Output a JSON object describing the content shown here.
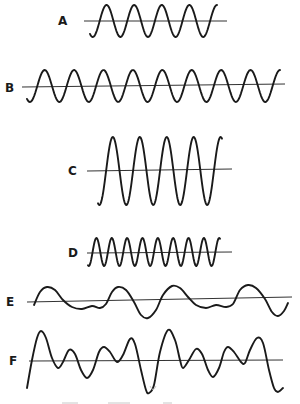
{
  "figure": {
    "background": "#ffffff",
    "ink_color": "#1a1a1a"
  },
  "waves": [
    {
      "label": "A",
      "kind": "sine",
      "label_pos": [
        58,
        25
      ],
      "baseline": [
        [
          84,
          21
        ],
        [
          227,
          21
        ]
      ],
      "x_start": 90,
      "x_end": 217,
      "center_y": 21,
      "amplitude": 16,
      "cycles": 4,
      "phase_start": -0.35,
      "description": "Medium amplitude, low frequency (4 cycles)"
    },
    {
      "label": "B",
      "kind": "sine",
      "label_pos": [
        5,
        92
      ],
      "baseline": [
        [
          22,
          87
        ],
        [
          285,
          84
        ]
      ],
      "x_start": 27,
      "x_end": 280,
      "center_y": 86,
      "amplitude": 16,
      "cycles": 8,
      "phase_start": -0.35,
      "description": "Medium amplitude, higher frequency (8 cycles)"
    },
    {
      "label": "C",
      "kind": "sine",
      "label_pos": [
        68,
        175
      ],
      "baseline": [
        [
          87,
          171
        ],
        [
          232,
          169
        ]
      ],
      "x_start": 98,
      "x_end": 222,
      "center_y": 171,
      "amplitude": 34,
      "cycles": 4,
      "phase_start": -0.3,
      "description": "Large amplitude, low frequency (4 cycles)"
    },
    {
      "label": "D",
      "kind": "sine",
      "label_pos": [
        68,
        257
      ],
      "baseline": [
        [
          87,
          253
        ],
        [
          232,
          252
        ]
      ],
      "x_start": 88,
      "x_end": 220,
      "center_y": 252,
      "amplitude": 14,
      "cycles": 8,
      "phase_start": -0.3,
      "description": "Medium amplitude, high frequency (8 cycles) compressed"
    },
    {
      "label": "E",
      "kind": "freehand",
      "label_pos": [
        6,
        306
      ],
      "baseline": [
        [
          27,
          302
        ],
        [
          292,
          297
        ]
      ],
      "points": [
        [
          34,
          305
        ],
        [
          40,
          292
        ],
        [
          47,
          287
        ],
        [
          55,
          290
        ],
        [
          63,
          300
        ],
        [
          72,
          307
        ],
        [
          82,
          309
        ],
        [
          92,
          306
        ],
        [
          100,
          308
        ],
        [
          106,
          304
        ],
        [
          112,
          292
        ],
        [
          118,
          287
        ],
        [
          126,
          290
        ],
        [
          134,
          302
        ],
        [
          141,
          315
        ],
        [
          148,
          318
        ],
        [
          156,
          310
        ],
        [
          163,
          295
        ],
        [
          172,
          286
        ],
        [
          180,
          288
        ],
        [
          188,
          297
        ],
        [
          196,
          305
        ],
        [
          206,
          308
        ],
        [
          216,
          305
        ],
        [
          226,
          307
        ],
        [
          233,
          304
        ],
        [
          240,
          290
        ],
        [
          248,
          285
        ],
        [
          256,
          288
        ],
        [
          265,
          299
        ],
        [
          272,
          312
        ],
        [
          278,
          316
        ],
        [
          284,
          311
        ],
        [
          288,
          303
        ]
      ],
      "description": "Complex low-amplitude wave with irregular repeating pattern"
    },
    {
      "label": "F",
      "kind": "freehand",
      "label_pos": [
        9,
        365
      ],
      "baseline": [
        [
          29,
          361
        ],
        [
          283,
          360
        ]
      ],
      "points": [
        [
          27,
          388
        ],
        [
          32,
          360
        ],
        [
          37,
          338
        ],
        [
          41,
          331
        ],
        [
          46,
          338
        ],
        [
          52,
          358
        ],
        [
          58,
          368
        ],
        [
          63,
          362
        ],
        [
          69,
          350
        ],
        [
          75,
          354
        ],
        [
          81,
          370
        ],
        [
          87,
          378
        ],
        [
          93,
          370
        ],
        [
          99,
          352
        ],
        [
          104,
          347
        ],
        [
          110,
          352
        ],
        [
          117,
          362
        ],
        [
          123,
          355
        ],
        [
          130,
          339
        ],
        [
          135,
          344
        ],
        [
          141,
          370
        ],
        [
          146,
          390
        ],
        [
          149,
          393
        ],
        [
          154,
          385
        ],
        [
          160,
          352
        ],
        [
          168,
          330
        ],
        [
          175,
          340
        ],
        [
          180,
          360
        ],
        [
          183,
          368
        ],
        [
          189,
          360
        ],
        [
          196,
          349
        ],
        [
          202,
          354
        ],
        [
          208,
          370
        ],
        [
          213,
          377
        ],
        [
          219,
          368
        ],
        [
          224,
          352
        ],
        [
          228,
          347
        ],
        [
          234,
          352
        ],
        [
          241,
          362
        ],
        [
          245,
          363
        ],
        [
          250,
          350
        ],
        [
          257,
          338
        ],
        [
          263,
          343
        ],
        [
          269,
          370
        ],
        [
          274,
          388
        ],
        [
          278,
          392
        ],
        [
          283,
          388
        ]
      ],
      "description": "Complex large-amplitude wave with multiple harmonics"
    }
  ],
  "footer": {
    "note": "faint cut-off marks at bottom edge (illegible)"
  }
}
